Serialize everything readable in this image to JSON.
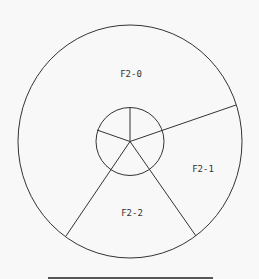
{
  "diagram": {
    "type": "concentric-sector-diagram",
    "stroke_color": "#333333",
    "background_color": "#f8f8f8",
    "outer_circle": {
      "cx": 130,
      "cy": 141.5,
      "rx": 112,
      "ry": 116.5
    },
    "inner_circle": {
      "cx": 130,
      "cy": 141.5,
      "r": 34
    },
    "center": {
      "x": 130,
      "y": 141.5
    },
    "long_spokes": [
      {
        "x": 236,
        "y": 105
      },
      {
        "x": 196,
        "y": 236
      },
      {
        "x": 66,
        "y": 236
      }
    ],
    "short_spokes": [
      {
        "x": 130,
        "y": 107.5
      },
      {
        "x": 97,
        "y": 130
      }
    ],
    "regions": [
      {
        "id": "F2-0",
        "label": "F2-0",
        "x": 131,
        "y": 74
      },
      {
        "id": "F2-1",
        "label": "F2-1",
        "x": 203,
        "y": 169
      },
      {
        "id": "F2-2",
        "label": "F2-2",
        "x": 132,
        "y": 213
      }
    ],
    "baseline": {
      "x1": 48,
      "x2": 213,
      "y": 278
    }
  }
}
